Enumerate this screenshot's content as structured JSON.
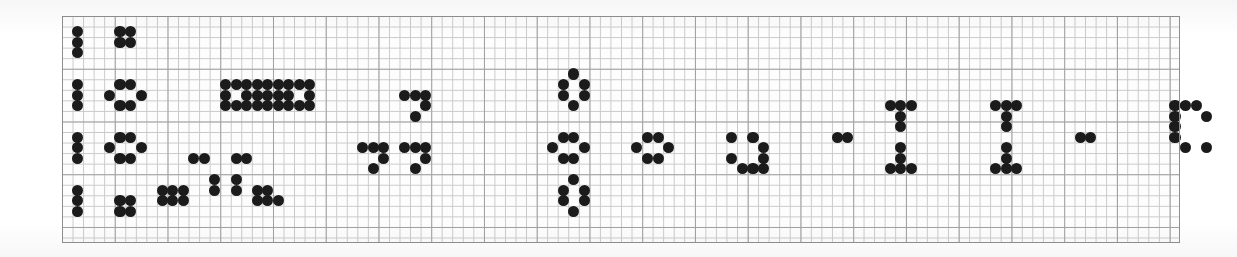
{
  "figure": {
    "kind": "dot-grid-pattern",
    "canvas_width": 1237,
    "canvas_height": 257
  },
  "grid": {
    "left": 62,
    "top": 16,
    "width": 1118,
    "height": 227,
    "cell": 10.55,
    "cols": 106,
    "rows": 21,
    "major_every": 5,
    "minor_line_color": "#c9c9c9",
    "major_line_color": "#9a9a9a",
    "border_color": "#8f8f8f",
    "paper_color": "#fdfdfd",
    "show_grid": true
  },
  "dots": {
    "color": "#1b1b1b",
    "diameter_cells": 1.05,
    "count": 216,
    "cells": [
      [
        1,
        1
      ],
      [
        1,
        2
      ],
      [
        1,
        3
      ],
      [
        5,
        1
      ],
      [
        6,
        1
      ],
      [
        5,
        2
      ],
      [
        6,
        2
      ],
      [
        1,
        6
      ],
      [
        1,
        7
      ],
      [
        1,
        8
      ],
      [
        5,
        6
      ],
      [
        6,
        6
      ],
      [
        4,
        7
      ],
      [
        7,
        7
      ],
      [
        5,
        8
      ],
      [
        6,
        8
      ],
      [
        15,
        6
      ],
      [
        16,
        6
      ],
      [
        17,
        6
      ],
      [
        18,
        6
      ],
      [
        19,
        6
      ],
      [
        20,
        6
      ],
      [
        21,
        6
      ],
      [
        22,
        6
      ],
      [
        23,
        6
      ],
      [
        15,
        7
      ],
      [
        17,
        7
      ],
      [
        18,
        7
      ],
      [
        19,
        7
      ],
      [
        20,
        7
      ],
      [
        21,
        7
      ],
      [
        23,
        7
      ],
      [
        15,
        8
      ],
      [
        16,
        8
      ],
      [
        17,
        8
      ],
      [
        18,
        8
      ],
      [
        19,
        8
      ],
      [
        20,
        8
      ],
      [
        21,
        8
      ],
      [
        22,
        8
      ],
      [
        23,
        8
      ],
      [
        32,
        7
      ],
      [
        33,
        7
      ],
      [
        34,
        7
      ],
      [
        34,
        8
      ],
      [
        33,
        9
      ],
      [
        1,
        11
      ],
      [
        1,
        12
      ],
      [
        1,
        13
      ],
      [
        5,
        11
      ],
      [
        6,
        11
      ],
      [
        4,
        12
      ],
      [
        7,
        12
      ],
      [
        5,
        13
      ],
      [
        6,
        13
      ],
      [
        12,
        13
      ],
      [
        13,
        13
      ],
      [
        16,
        13
      ],
      [
        17,
        13
      ],
      [
        14,
        15
      ],
      [
        14,
        16
      ],
      [
        16,
        15
      ],
      [
        16,
        16
      ],
      [
        9,
        16
      ],
      [
        10,
        16
      ],
      [
        11,
        16
      ],
      [
        9,
        17
      ],
      [
        10,
        17
      ],
      [
        11,
        17
      ],
      [
        18,
        17
      ],
      [
        19,
        17
      ],
      [
        20,
        17
      ],
      [
        18,
        16
      ],
      [
        19,
        16
      ],
      [
        28,
        12
      ],
      [
        29,
        12
      ],
      [
        30,
        12
      ],
      [
        30,
        13
      ],
      [
        29,
        14
      ],
      [
        32,
        12
      ],
      [
        33,
        12
      ],
      [
        34,
        12
      ],
      [
        34,
        13
      ],
      [
        33,
        14
      ],
      [
        48,
        5
      ],
      [
        47,
        6
      ],
      [
        49,
        6
      ],
      [
        47,
        7
      ],
      [
        49,
        7
      ],
      [
        48,
        8
      ],
      [
        47,
        11
      ],
      [
        48,
        11
      ],
      [
        46,
        12
      ],
      [
        49,
        12
      ],
      [
        47,
        13
      ],
      [
        48,
        13
      ],
      [
        48,
        15
      ],
      [
        47,
        16
      ],
      [
        49,
        16
      ],
      [
        47,
        17
      ],
      [
        49,
        17
      ],
      [
        48,
        18
      ],
      [
        55,
        11
      ],
      [
        56,
        11
      ],
      [
        54,
        12
      ],
      [
        57,
        12
      ],
      [
        55,
        13
      ],
      [
        56,
        13
      ],
      [
        63,
        11
      ],
      [
        65,
        11
      ],
      [
        66,
        12
      ],
      [
        66,
        13
      ],
      [
        63,
        13
      ],
      [
        66,
        14
      ],
      [
        64,
        14
      ],
      [
        65,
        14
      ],
      [
        73,
        11
      ],
      [
        74,
        11
      ],
      [
        78,
        8
      ],
      [
        79,
        8
      ],
      [
        80,
        8
      ],
      [
        79,
        9
      ],
      [
        79,
        10
      ],
      [
        79,
        12
      ],
      [
        79,
        13
      ],
      [
        78,
        14
      ],
      [
        79,
        14
      ],
      [
        80,
        14
      ],
      [
        88,
        8
      ],
      [
        89,
        8
      ],
      [
        90,
        8
      ],
      [
        89,
        9
      ],
      [
        89,
        10
      ],
      [
        89,
        12
      ],
      [
        89,
        13
      ],
      [
        88,
        14
      ],
      [
        89,
        14
      ],
      [
        90,
        14
      ],
      [
        96,
        11
      ],
      [
        97,
        11
      ],
      [
        105,
        8
      ],
      [
        106,
        8
      ],
      [
        107,
        8
      ],
      [
        105,
        9
      ],
      [
        108,
        9
      ],
      [
        105,
        10
      ],
      [
        105,
        11
      ],
      [
        106,
        12
      ],
      [
        108,
        12
      ],
      [
        121,
        1
      ],
      [
        122,
        1
      ],
      [
        121,
        2
      ],
      [
        122,
        2
      ],
      [
        121,
        6
      ],
      [
        122,
        6
      ],
      [
        120,
        7
      ],
      [
        123,
        7
      ],
      [
        121,
        8
      ],
      [
        122,
        8
      ],
      [
        121,
        11
      ],
      [
        122,
        11
      ],
      [
        120,
        12
      ],
      [
        123,
        12
      ],
      [
        121,
        13
      ],
      [
        122,
        13
      ],
      [
        121,
        16
      ],
      [
        122,
        16
      ],
      [
        121,
        17
      ],
      [
        122,
        17
      ],
      [
        128,
        1
      ],
      [
        128,
        2
      ],
      [
        128,
        3
      ],
      [
        128,
        6
      ],
      [
        128,
        7
      ],
      [
        128,
        8
      ],
      [
        128,
        11
      ],
      [
        128,
        12
      ],
      [
        128,
        13
      ],
      [
        128,
        16
      ],
      [
        128,
        17
      ],
      [
        128,
        18
      ],
      [
        1,
        16
      ],
      [
        1,
        17
      ],
      [
        1,
        18
      ],
      [
        5,
        17
      ],
      [
        6,
        17
      ],
      [
        5,
        18
      ],
      [
        6,
        18
      ]
    ]
  },
  "chart_data": {
    "type": "heatmap",
    "title": "",
    "xlabel": "",
    "ylabel": "",
    "grid": true,
    "legend": "none",
    "columns": 130,
    "rows": 20,
    "filled_cell_count": 216
  }
}
